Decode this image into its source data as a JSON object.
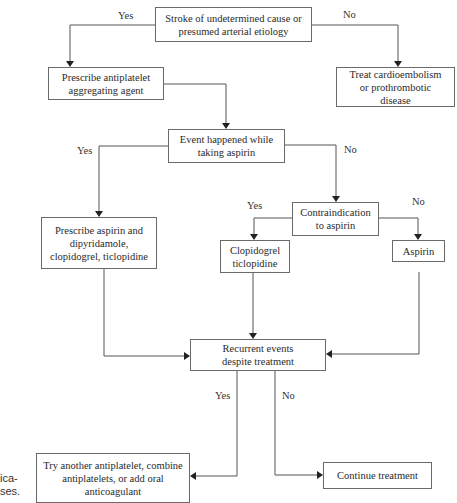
{
  "diagram": {
    "type": "flowchart",
    "nodes": {
      "start": "Stroke of undetermined cause or presumed arterial etiology",
      "antiplatelet": "Prescribe antiplatelet aggregating agent",
      "cardioembolism": "Treat cardioembolism or prothrombotic disease",
      "event_aspirin": "Event happened while taking aspirin",
      "combo": "Prescribe aspirin and dipyridamole, clopidogrel, ticlopidine",
      "contraindication": "Contraindication to aspirin",
      "clopidogrel": "Clopidogrel ticlopidine",
      "aspirin": "Aspirin",
      "recurrent": "Recurrent events despite treatment",
      "try_another": "Try another antiplatelet, combine antiplatelets, or add oral anticoagulant",
      "continue": "Continue treatment"
    },
    "edge_labels": {
      "start_yes": "Yes",
      "start_no": "No",
      "event_yes": "Yes",
      "event_no": "No",
      "contra_yes": "Yes",
      "contra_no": "No",
      "recurrent_yes": "Yes",
      "recurrent_no": "No"
    },
    "edges": [
      {
        "from": "start",
        "to": "antiplatelet",
        "label": "Yes"
      },
      {
        "from": "start",
        "to": "cardioembolism",
        "label": "No"
      },
      {
        "from": "antiplatelet",
        "to": "event_aspirin"
      },
      {
        "from": "event_aspirin",
        "to": "combo",
        "label": "Yes"
      },
      {
        "from": "event_aspirin",
        "to": "contraindication",
        "label": "No"
      },
      {
        "from": "contraindication",
        "to": "clopidogrel",
        "label": "Yes"
      },
      {
        "from": "contraindication",
        "to": "aspirin",
        "label": "No"
      },
      {
        "from": "combo",
        "to": "recurrent"
      },
      {
        "from": "clopidogrel",
        "to": "recurrent"
      },
      {
        "from": "aspirin",
        "to": "recurrent"
      },
      {
        "from": "recurrent",
        "to": "try_another",
        "label": "Yes"
      },
      {
        "from": "recurrent",
        "to": "continue",
        "label": "No"
      }
    ]
  },
  "clipped_caption": {
    "line1": "ica-",
    "line2": "ses."
  }
}
